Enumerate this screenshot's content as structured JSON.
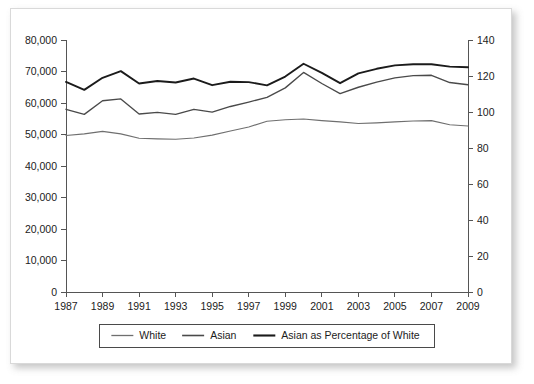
{
  "figure": {
    "background_color": "#ffffff",
    "border_color": "#d9d9d9"
  },
  "chart_data": {
    "type": "line",
    "title": "",
    "subtitle": "",
    "xlabel": "",
    "ylabel": "",
    "y2label": "",
    "grid": false,
    "legend_position": "bottom",
    "x": [
      1987,
      1988,
      1989,
      1990,
      1991,
      1992,
      1993,
      1994,
      1995,
      1996,
      1997,
      1998,
      1999,
      2000,
      2001,
      2002,
      2003,
      2004,
      2005,
      2006,
      2007,
      2008,
      2009
    ],
    "xtick_labels": [
      "1987",
      "1989",
      "1991",
      "1993",
      "1995",
      "1997",
      "1999",
      "2001",
      "2003",
      "2005",
      "2007",
      "2009"
    ],
    "xtick_values": [
      1987,
      1989,
      1991,
      1993,
      1995,
      1997,
      1999,
      2001,
      2003,
      2005,
      2007,
      2009
    ],
    "xlim": [
      1987,
      2009
    ],
    "ylim": [
      0,
      80000
    ],
    "ytick_labels": [
      "0",
      "10,000",
      "20,000",
      "30,000",
      "40,000",
      "50,000",
      "60,000",
      "70,000",
      "80,000"
    ],
    "ytick_values": [
      0,
      10000,
      20000,
      30000,
      40000,
      50000,
      60000,
      70000,
      80000
    ],
    "y2lim": [
      0,
      140
    ],
    "y2tick_labels": [
      "0",
      "20",
      "40",
      "60",
      "80",
      "100",
      "120",
      "140"
    ],
    "y2tick_values": [
      0,
      20,
      40,
      60,
      80,
      100,
      120,
      140
    ],
    "series": [
      {
        "name": "White",
        "axis": "left",
        "color": "#6f6f6f",
        "values": [
          49700,
          50200,
          51000,
          50200,
          48800,
          48600,
          48500,
          48900,
          49800,
          51100,
          52400,
          54200,
          54700,
          54900,
          54400,
          54000,
          53500,
          53700,
          54000,
          54300,
          54400,
          53100,
          52700
        ]
      },
      {
        "name": "Asian",
        "axis": "left",
        "color": "#4a4a4a",
        "values": [
          58000,
          56400,
          60700,
          61300,
          56500,
          57000,
          56400,
          58000,
          57100,
          58900,
          60300,
          61800,
          64800,
          69700,
          66200,
          63000,
          65000,
          66600,
          68000,
          68700,
          68800,
          66500,
          65800
        ]
      },
      {
        "name": "Asian as Percentage of White",
        "axis": "right",
        "color": "#1b1b1b",
        "values": [
          116.7,
          112.3,
          119.0,
          122.7,
          115.8,
          117.2,
          116.4,
          118.6,
          114.9,
          116.8,
          116.6,
          114.8,
          119.7,
          126.8,
          121.7,
          116.0,
          121.5,
          124.0,
          125.9,
          126.5,
          126.5,
          125.2,
          124.9
        ]
      }
    ],
    "legend": [
      {
        "label": "White",
        "color": "#6f6f6f"
      },
      {
        "label": "Asian",
        "color": "#4a4a4a"
      },
      {
        "label": "Asian as Percentage of White",
        "color": "#1b1b1b"
      }
    ]
  }
}
